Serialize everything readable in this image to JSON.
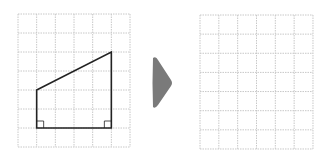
{
  "figure": {
    "left_grid": {
      "columns": 6,
      "rows": 7,
      "origin": [
        18,
        14
      ],
      "cell_w": 18.67,
      "cell_h": 19,
      "line_color": "#c8c8c8"
    },
    "shape": {
      "type": "right trapezoid",
      "vertices_grid": [
        [
          1,
          4
        ],
        [
          5,
          2
        ],
        [
          5,
          6
        ],
        [
          1,
          6
        ]
      ],
      "stroke_color": "#222222",
      "right_angle_marks": [
        "bottom-left",
        "bottom-right"
      ]
    },
    "arrow": {
      "direction": "right",
      "color": "#7a7a7a"
    },
    "right_grid": {
      "columns": 6,
      "rows": 7,
      "origin": [
        200,
        15
      ],
      "cell_w": 18.83,
      "cell_h": 19.14,
      "line_color": "#c8c8c8"
    }
  }
}
